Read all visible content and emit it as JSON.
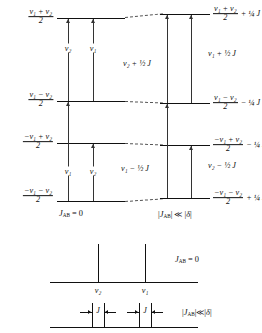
{
  "figure": {
    "type": "energy-level-diagram",
    "conditions": {
      "left": "J_AB = 0",
      "left_plain": "JAB = 0",
      "right": "|J_AB| << |delta|",
      "right_plain": "|JAB| ≪ |δ|"
    }
  },
  "levels": [
    {
      "id": "level-1",
      "left_label": {
        "numerator": "ν₁ + ν₂",
        "denominator": "2",
        "sign": ""
      },
      "right_label": {
        "numerator": "ν₁ + ν₂",
        "denominator": "2",
        "offset": "+ ¼ J"
      }
    },
    {
      "id": "level-2",
      "left_label": {
        "numerator": "ν₁ − ν₂",
        "denominator": "2",
        "sign": ""
      },
      "right_label": {
        "numerator": "ν₁ − ν₂",
        "denominator": "2",
        "offset": "− ¼ J"
      }
    },
    {
      "id": "level-3",
      "left_label": {
        "numerator": "−ν₁ + ν₂",
        "denominator": "2",
        "sign": "−"
      },
      "right_label": {
        "numerator": "−ν₁ + ν₂",
        "denominator": "2",
        "offset": "− ¼ J"
      }
    },
    {
      "id": "level-4",
      "left_label": {
        "numerator": "−ν₁ − ν₂",
        "denominator": "2",
        "sign": "−"
      },
      "right_label": {
        "numerator": "−ν₁ − ν₂",
        "denominator": "2",
        "offset": "+ ¼ J"
      }
    }
  ],
  "transitions": {
    "left_unperturbed": [
      {
        "id": "t-upper-left",
        "label": "ν₂"
      },
      {
        "id": "t-upper-right",
        "label": "ν₁"
      },
      {
        "id": "t-lower-left",
        "label": "ν₁"
      },
      {
        "id": "t-lower-right",
        "label": "ν₂"
      }
    ],
    "right_coupled": [
      {
        "id": "t-c-upper-left",
        "label": "ν₂ + ½ J"
      },
      {
        "id": "t-c-upper-right",
        "label": "ν₁ + ½ J"
      },
      {
        "id": "t-c-lower-left",
        "label": "ν₁ − ½ J"
      },
      {
        "id": "t-c-lower-right",
        "label": "ν₂ − ½ J"
      }
    ]
  },
  "spectra": [
    {
      "id": "spectrum-uncoupled",
      "condition": "J_AB = 0",
      "condition_text": "JAB = 0",
      "peaks": [
        {
          "label": "ν₂",
          "x": 98
        },
        {
          "label": "ν₁",
          "x": 145
        }
      ]
    },
    {
      "id": "spectrum-coupled",
      "condition": "|J_AB| << |delta|",
      "condition_text": "|JAB| ≪ |δ|",
      "doublets": [
        {
          "center": 98,
          "splitting_label": "J"
        },
        {
          "center": 145,
          "splitting_label": "J"
        }
      ]
    }
  ],
  "symbols": {
    "nu": "ν",
    "J": "J",
    "delta": "δ",
    "much_less": "≪",
    "quarter": "¼",
    "half": "½"
  }
}
